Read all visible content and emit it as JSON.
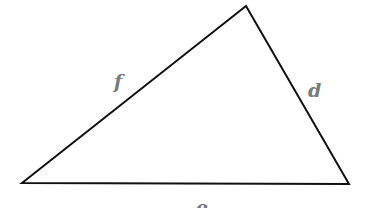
{
  "diagram": {
    "type": "triangle",
    "stroke_color": "#111111",
    "label_color": "#7a7a7a",
    "vertices": {
      "top": [
        246,
        6
      ],
      "bottom_left": [
        22,
        183
      ],
      "bottom_right": [
        349,
        184
      ]
    },
    "sides": [
      {
        "id": "f",
        "label": "f",
        "from": "bottom_left",
        "to": "top"
      },
      {
        "id": "d",
        "label": "d",
        "from": "top",
        "to": "bottom_right"
      },
      {
        "id": "e",
        "label": "e",
        "from": "bottom_left",
        "to": "bottom_right"
      }
    ]
  }
}
